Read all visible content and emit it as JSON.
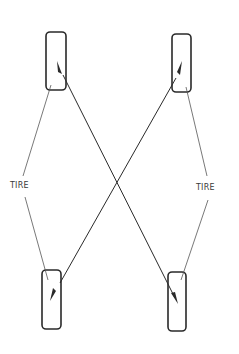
{
  "diagram": {
    "labels": {
      "left": "TIRE",
      "right": "TIRE"
    },
    "tires": [
      {
        "position": "front-left",
        "x": 46,
        "y": 32,
        "w": 20,
        "h": 58
      },
      {
        "position": "front-right",
        "x": 172,
        "y": 34,
        "w": 19,
        "h": 58
      },
      {
        "position": "rear-left",
        "x": 42,
        "y": 270,
        "w": 19,
        "h": 59
      },
      {
        "position": "rear-right",
        "x": 168,
        "y": 272,
        "w": 18,
        "h": 59
      }
    ],
    "rotation_arrows": [
      {
        "from": "rear-right",
        "to": "front-left"
      },
      {
        "from": "rear-left",
        "to": "front-right"
      },
      {
        "from": "front-left",
        "to": "rear-right"
      },
      {
        "from": "front-right",
        "to": "rear-left"
      }
    ],
    "colors": {
      "stroke": "#2a2a2a",
      "background": "#ffffff"
    }
  }
}
